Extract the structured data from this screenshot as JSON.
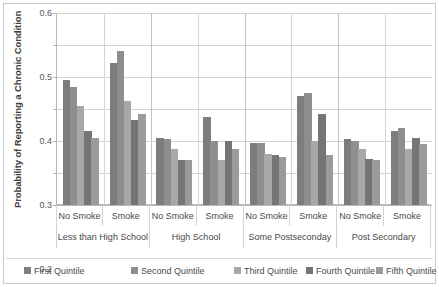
{
  "chart_data": {
    "type": "bar",
    "title": "",
    "xlabel": "",
    "ylabel": "Probability of Reporting a Chronic Condition",
    "ylim": [
      0,
      0.6
    ],
    "yticks": [
      "0",
      "0.1",
      "0.2",
      "0.3",
      "0.4",
      "0.5",
      "0.6"
    ],
    "ytick_values": [
      0,
      0.1,
      0.2,
      0.3,
      0.4,
      0.5,
      0.6
    ],
    "grid": true,
    "legend_position": "bottom",
    "categories": [
      "No Smoke",
      "Smoke",
      "No Smoke",
      "Smoke",
      "No Smoke",
      "Smoke",
      "No Smoke",
      "Smoke"
    ],
    "group_labels": [
      "Less than High School",
      "High School",
      "Some Postseconday",
      "Post Secondary"
    ],
    "series": [
      {
        "name": "First Quintile",
        "color": "#7d7d7d",
        "values": [
          0.39,
          0.445,
          0.21,
          0.275,
          0.195,
          0.34,
          0.205,
          0.23
        ]
      },
      {
        "name": "Second Quintile",
        "color": "#8e8e8e",
        "values": [
          0.37,
          0.48,
          0.205,
          0.2,
          0.195,
          0.35,
          0.2,
          0.24
        ]
      },
      {
        "name": "Third Quintile",
        "color": "#a8a8a8",
        "values": [
          0.31,
          0.325,
          0.175,
          0.14,
          0.16,
          0.2,
          0.175,
          0.175
        ]
      },
      {
        "name": "Fourth Quintile",
        "color": "#757575",
        "values": [
          0.23,
          0.265,
          0.14,
          0.2,
          0.155,
          0.285,
          0.145,
          0.21
        ]
      },
      {
        "name": "Fifth Quintile",
        "color": "#9b9b9b",
        "values": [
          0.21,
          0.285,
          0.14,
          0.175,
          0.15,
          0.155,
          0.14,
          0.19
        ]
      }
    ]
  }
}
